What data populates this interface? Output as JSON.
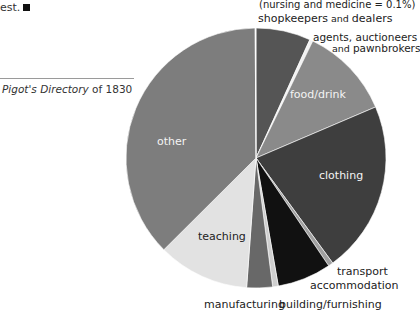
{
  "page": {
    "top_text": "est.",
    "caption_italic": "Pigot's Directory",
    "caption_rest": " of 1830"
  },
  "chart_data": {
    "type": "pie",
    "title": "",
    "source": "Pigot's Directory of 1830",
    "start_angle": "12 o'clock, clockwise",
    "note": "(nursing and medicine = 0.1%)",
    "slices": [
      {
        "label": "shopkeepers and dealers",
        "value": 6.8,
        "color": "#555555"
      },
      {
        "label": "agents, auctioneers and pawnbrokers",
        "value": 0.4,
        "color": "#f2f2f2"
      },
      {
        "label": "food/drink",
        "value": 11.4,
        "color": "#8a8a8a"
      },
      {
        "label": "clothing",
        "value": 21.4,
        "color": "#3e3e3e"
      },
      {
        "label": "transport",
        "value": 0.6,
        "color": "#a0a0a0"
      },
      {
        "label": "accommodation",
        "value": 6.7,
        "color": "#111111"
      },
      {
        "label": "building/furnishing",
        "value": 0.7,
        "color": "#cfcfcf"
      },
      {
        "label": "manufacturing",
        "value": 3.2,
        "color": "#686868"
      },
      {
        "label": "teaching",
        "value": 11.4,
        "color": "#e2e2e2"
      },
      {
        "label": "other",
        "value": 37.4,
        "color": "#7d7d7d"
      },
      {
        "label": "nursing and medicine",
        "value": 0.1,
        "color": "#ffffff"
      }
    ]
  },
  "labels": {
    "note": "(nursing and medicine = 0.1%)",
    "shopkeepers_a": "shopkeepers",
    "shopkeepers_and": " and ",
    "shopkeepers_b": "dealers",
    "agents_1": "agents, auctioneers",
    "agents_2a": "and ",
    "agents_2b": "pawnbrokers",
    "food": "food/drink",
    "clothing": "clothing",
    "transport": "transport",
    "accommodation": "accommodation",
    "building": "building/furnishing",
    "manufacturing": "manufacturing",
    "teaching": "teaching",
    "other": "other"
  }
}
